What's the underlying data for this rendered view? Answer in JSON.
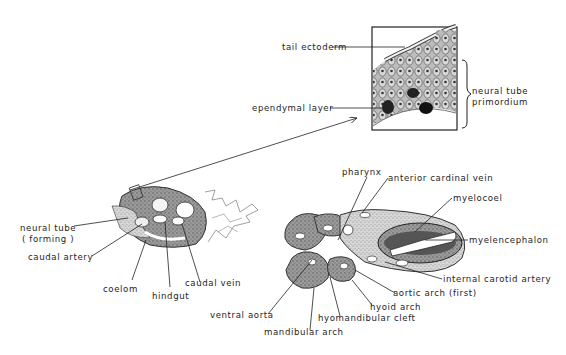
{
  "figure": {
    "type": "embryo cross-section diagram",
    "inset": {
      "labels": {
        "tail_ectoderm": "tail ectoderm",
        "ependymal_layer": "ependymal layer",
        "neural_tube_primordium_1": "neural tube",
        "neural_tube_primordium_2": "primordium"
      }
    },
    "tail_section": {
      "labels": {
        "neural_tube_forming_1": "neural tube",
        "neural_tube_forming_2": "( forming )",
        "caudal_artery": "caudal artery",
        "coelom": "coelom",
        "hindgut": "hindgut",
        "caudal_vein": "caudal vein"
      }
    },
    "head_section": {
      "labels": {
        "pharynx": "pharynx",
        "anterior_cardinal_vein": "anterior cardinal vein",
        "myelocoel": "myelocoel",
        "myelencephalon": "myelencephalon",
        "internal_carotid_artery": "internal carotid artery",
        "aortic_arch": "aortic arch (first)",
        "hyoid_arch": "hyoid arch",
        "hyomandibular_cleft": "hyomandibular cleft",
        "ventral_aorta": "ventral aorta",
        "mandibular_arch": "mandibular arch"
      }
    },
    "colors": {
      "ink": "#1e1e1e",
      "tissue": "#8a8a8a",
      "tissue_light": "#c8c8c8",
      "background": "#ffffff"
    }
  }
}
